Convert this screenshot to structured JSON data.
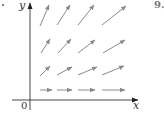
{
  "figure": {
    "problem_number": "9.",
    "axis_labels": {
      "x": "x",
      "y": "y",
      "origin": "0"
    },
    "colors": {
      "axis": "#333333",
      "arrow": "#8a8a8a"
    }
  },
  "chart_data": {
    "type": "vector_field",
    "title": "",
    "xlabel": "x",
    "ylabel": "y",
    "origin_label": "0",
    "grid_points": [
      {
        "row": 0,
        "col": 0,
        "x": 1,
        "y": 0
      },
      {
        "row": 0,
        "col": 1,
        "x": 2,
        "y": 0
      },
      {
        "row": 0,
        "col": 2,
        "x": 3,
        "y": 0
      },
      {
        "row": 0,
        "col": 3,
        "x": 4,
        "y": 0
      },
      {
        "row": 1,
        "col": 0,
        "x": 1,
        "y": 1
      },
      {
        "row": 1,
        "col": 1,
        "x": 2,
        "y": 1
      },
      {
        "row": 1,
        "col": 2,
        "x": 3,
        "y": 1
      },
      {
        "row": 1,
        "col": 3,
        "x": 4,
        "y": 1
      },
      {
        "row": 2,
        "col": 0,
        "x": 1,
        "y": 2
      },
      {
        "row": 2,
        "col": 1,
        "x": 2,
        "y": 2
      },
      {
        "row": 2,
        "col": 2,
        "x": 3,
        "y": 2
      },
      {
        "row": 2,
        "col": 3,
        "x": 4,
        "y": 2
      },
      {
        "row": 3,
        "col": 0,
        "x": 1,
        "y": 3
      },
      {
        "row": 3,
        "col": 1,
        "x": 2,
        "y": 3
      },
      {
        "row": 3,
        "col": 2,
        "x": 3,
        "y": 3
      },
      {
        "row": 3,
        "col": 3,
        "x": 4,
        "y": 3
      }
    ],
    "arrows_px": [
      [
        40,
        90,
        52,
        90
      ],
      [
        57,
        90,
        72,
        90
      ],
      [
        78,
        90,
        95,
        90
      ],
      [
        102,
        90,
        125,
        90
      ],
      [
        40,
        76,
        50,
        66
      ],
      [
        57,
        75,
        72,
        67
      ],
      [
        78,
        75,
        97,
        67
      ],
      [
        102,
        75,
        124,
        66
      ],
      [
        41,
        53,
        50,
        39
      ],
      [
        58,
        53,
        71,
        39
      ],
      [
        78,
        53,
        95,
        40
      ],
      [
        103,
        53,
        125,
        40
      ],
      [
        40,
        26,
        49,
        5
      ],
      [
        57,
        25,
        70,
        5
      ],
      [
        78,
        25,
        94,
        5
      ],
      [
        102,
        25,
        126,
        6
      ]
    ],
    "axes": {
      "x_axis_y_px": 100,
      "y_axis_x_px": 30,
      "x_end_px": 138,
      "y_top_px": 3
    }
  }
}
